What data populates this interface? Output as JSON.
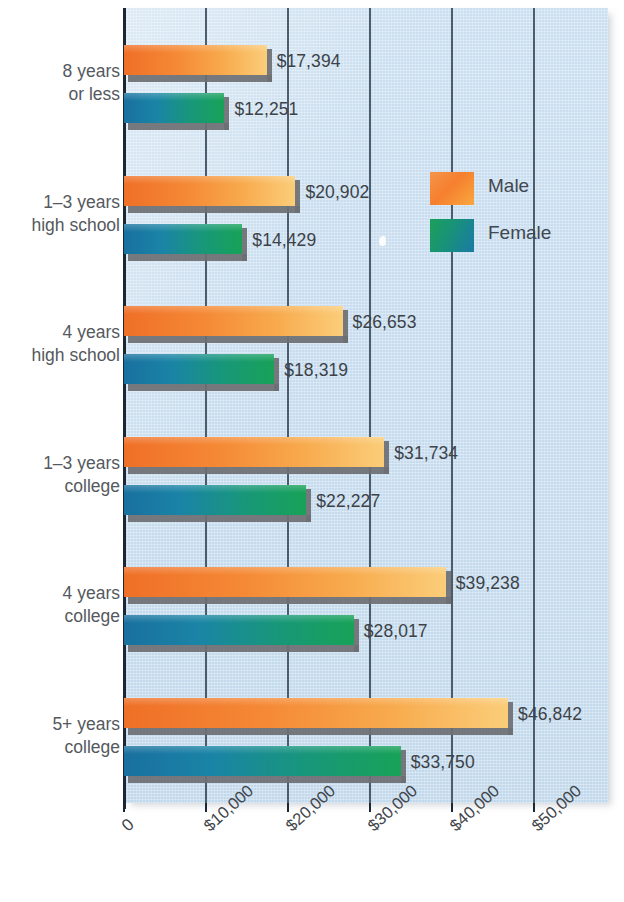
{
  "chart_data": {
    "type": "bar",
    "orientation": "horizontal",
    "title": "",
    "subtitle": "",
    "xlabel": "",
    "ylabel": "",
    "xlim": [
      0,
      60000
    ],
    "grid": true,
    "gridlines_at": [
      0,
      10000,
      20000,
      30000,
      40000,
      50000
    ],
    "xtick_labels": [
      "0",
      "$10,000",
      "$20,000",
      "$30,000",
      "$40,000",
      "$50,000"
    ],
    "xtick_values": [
      0,
      10000,
      20000,
      30000,
      40000,
      50000
    ],
    "categories": [
      "8 years or less",
      "1–3 years high school",
      "4 years high school",
      "1–3 years college",
      "4 years college",
      "5+ years college"
    ],
    "category_lines": [
      [
        "8 years",
        "or less"
      ],
      [
        "1–3 years",
        "high school"
      ],
      [
        "4 years",
        "high school"
      ],
      [
        "1–3 years",
        "college"
      ],
      [
        "4 years",
        "college"
      ],
      [
        "5+ years",
        "college"
      ]
    ],
    "legend_position": "inside-upper-right",
    "series": [
      {
        "name": "Male",
        "color": "#f58a36",
        "values": [
          17394,
          20902,
          26653,
          31734,
          39238,
          46842
        ],
        "value_labels": [
          "$17,394",
          "$20,902",
          "$26,653",
          "$31,734",
          "$39,238",
          "$46,842"
        ]
      },
      {
        "name": "Female",
        "color": "#18977a",
        "values": [
          12251,
          14429,
          18319,
          22227,
          28017,
          33750
        ],
        "value_labels": [
          "$12,251",
          "$14,429",
          "$18,319",
          "$22,227",
          "$28,017",
          "$33,750"
        ]
      }
    ]
  },
  "legend": {
    "items": [
      {
        "label": "Male",
        "swatch": "male-swatch"
      },
      {
        "label": "Female",
        "swatch": "female-swatch"
      }
    ]
  },
  "colors": {
    "panel_background": "#c6dcee",
    "male_bar": "#f58a36",
    "female_bar": "#18977a",
    "bar_shadow": "#6d6f72",
    "axis": "#1d2733",
    "gridline": "#41505e",
    "label_text": "#55595e"
  }
}
